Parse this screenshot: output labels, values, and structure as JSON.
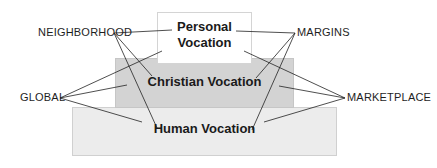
{
  "diagram": {
    "type": "layered-boxes",
    "layers": [
      {
        "id": "personal",
        "label": "Personal\nVocation",
        "label_lines": [
          "Personal",
          "Vocation"
        ],
        "fill": "#ffffff"
      },
      {
        "id": "christian",
        "label": "Christian Vocation",
        "fill": "#d3d3d3"
      },
      {
        "id": "human",
        "label": "Human Vocation",
        "fill": "#ececec"
      }
    ],
    "categories": {
      "neighborhood": "NEIGHBORHOOD",
      "margins": "MARGINS",
      "global": "GLOBAL",
      "marketplace": "MARKETPLACE"
    },
    "connections": [
      {
        "from": "NEIGHBORHOOD",
        "to": [
          "Personal Vocation",
          "Christian Vocation",
          "Human Vocation"
        ]
      },
      {
        "from": "MARGINS",
        "to": [
          "Personal Vocation",
          "Christian Vocation",
          "Human Vocation"
        ]
      },
      {
        "from": "GLOBAL",
        "to": [
          "Personal Vocation",
          "Christian Vocation",
          "Human Vocation"
        ]
      },
      {
        "from": "MARKETPLACE",
        "to": [
          "Personal Vocation",
          "Christian Vocation",
          "Human Vocation"
        ]
      }
    ]
  }
}
